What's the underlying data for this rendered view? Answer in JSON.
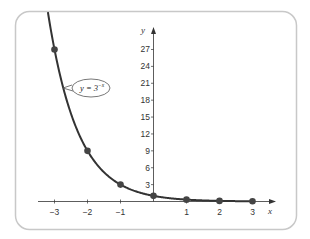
{
  "chart_data": {
    "type": "line",
    "title": "",
    "xlabel": "x",
    "ylabel": "y",
    "function_label": "y = 3",
    "function_exponent": "−x",
    "x_ticks": [
      -3,
      -2,
      -1,
      1,
      2,
      3
    ],
    "x_tick_labels": [
      "−3",
      "−2",
      "−1",
      "1",
      "2",
      "3"
    ],
    "y_ticks": [
      3,
      6,
      9,
      12,
      15,
      18,
      21,
      24,
      27
    ],
    "y_tick_labels": [
      "3",
      "6",
      "9",
      "12",
      "15",
      "18",
      "21",
      "24",
      "27"
    ],
    "xlim": [
      -3.3,
      3.6
    ],
    "ylim": [
      0,
      30
    ],
    "grid": false,
    "legend": "none",
    "points": [
      {
        "x": -3,
        "y": 27
      },
      {
        "x": -2,
        "y": 9
      },
      {
        "x": -1,
        "y": 3
      },
      {
        "x": 0,
        "y": 1
      },
      {
        "x": 1,
        "y": 0.333
      },
      {
        "x": 2,
        "y": 0.111
      },
      {
        "x": 3,
        "y": 0.037
      }
    ],
    "colors": {
      "curve": "#333333",
      "points": "#444444",
      "axis": "#333333",
      "frame": "#c8c8c8"
    }
  }
}
